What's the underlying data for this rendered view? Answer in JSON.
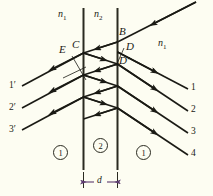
{
  "figure": {
    "background_color": "#fdfdf2",
    "ink_color": "#1a1a14",
    "medium_labels": {
      "left": "n",
      "left_sub": "1",
      "middle": "n",
      "middle_sub": "2",
      "right": "n",
      "right_sub": "1"
    },
    "point_labels": {
      "b": "B",
      "c": "C",
      "d": "D",
      "e": "E",
      "d_prime": "D′"
    },
    "left_rays": [
      "1′",
      "2′",
      "3′"
    ],
    "right_rays": [
      "1",
      "2",
      "3",
      "4"
    ],
    "region_labels": [
      "1",
      "2",
      "1"
    ],
    "thickness_label": "d"
  }
}
